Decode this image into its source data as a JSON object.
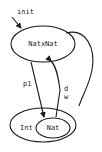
{
  "diagram": {
    "type": "type-graph",
    "colors": {
      "stroke": "#1a1a1a",
      "text": "#222222",
      "background": "#ffffff"
    },
    "nodes": {
      "natxnat": {
        "label": "NatxNat"
      },
      "int": {
        "label": "Int"
      },
      "nat": {
        "label": "Nat"
      }
    },
    "edges": {
      "init": {
        "label": "init"
      },
      "p1": {
        "label": "p1"
      },
      "d": {
        "label": "d"
      },
      "w": {
        "label": "w"
      }
    }
  }
}
